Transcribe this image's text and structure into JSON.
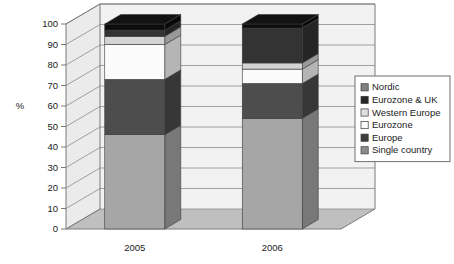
{
  "chart_data": {
    "type": "bar",
    "subtype": "stacked-3d-column",
    "title": "",
    "xlabel": "",
    "ylabel": "%",
    "categories": [
      "2005",
      "2006"
    ],
    "ylim": [
      0,
      100
    ],
    "ytick_labels": [
      "0",
      "10",
      "20",
      "30",
      "40",
      "50",
      "60",
      "70",
      "80",
      "90",
      "100"
    ],
    "ytick_values": [
      0,
      10,
      20,
      30,
      40,
      50,
      60,
      70,
      80,
      90,
      100
    ],
    "grid": true,
    "legend_position": "right",
    "stack_order_bottom_to_top": [
      "Single country",
      "Europe",
      "Eurozone",
      "Western Europe",
      "Eurozone & UK",
      "Nordic"
    ],
    "series": [
      {
        "name": "Single country",
        "color": "#a6a6a6",
        "values": [
          46,
          54
        ]
      },
      {
        "name": "Europe",
        "color": "#4d4d4d",
        "values": [
          27,
          17
        ]
      },
      {
        "name": "Eurozone",
        "color": "#fbfbfb",
        "values": [
          17,
          7
        ]
      },
      {
        "name": "Western Europe",
        "color": "#d4d4d4",
        "values": [
          4,
          3
        ]
      },
      {
        "name": "Eurozone & UK",
        "color": "#333333",
        "values": [
          3,
          17
        ]
      },
      {
        "name": "Nordic",
        "color": "#0d0d0d",
        "values": [
          3,
          2
        ]
      }
    ],
    "legend_entries": [
      {
        "label": "Nordic",
        "color": "#808080"
      },
      {
        "label": "Eurozone & UK",
        "color": "#262626"
      },
      {
        "label": "Western Europe",
        "color": "#e0e0e0"
      },
      {
        "label": "Eurozone",
        "color": "#fbfbfb"
      },
      {
        "label": "Europe",
        "color": "#3d3d3d"
      },
      {
        "label": "Single country",
        "color": "#8c8c8c"
      }
    ]
  },
  "colors": {
    "plot_back": "#f2f2f2",
    "plot_side": "#ebebeb",
    "floor": "#bfbfbf",
    "frame": "#7a7a7a",
    "grid": "#8c8c8c",
    "legend_border": "#6e6e6e",
    "text": "#1a1a1a"
  }
}
